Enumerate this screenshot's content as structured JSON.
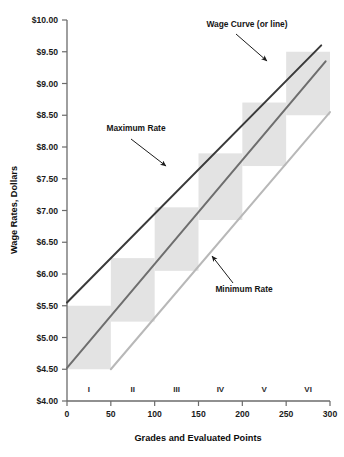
{
  "chart_data": {
    "type": "area",
    "title": "",
    "xlabel": "Grades and Evaluated Points",
    "ylabel": "Wage Rates, Dollars",
    "xlim": [
      0,
      300
    ],
    "ylim": [
      4.0,
      10.0
    ],
    "grid": false,
    "legend_position": "none",
    "x_ticks": [
      "0",
      "50",
      "100",
      "150",
      "200",
      "250",
      "300"
    ],
    "x_tick_values": [
      0,
      50,
      100,
      150,
      200,
      250,
      300
    ],
    "y_ticks": [
      "$4.00",
      "$4.50",
      "$5.00",
      "$5.50",
      "$6.00",
      "$6.50",
      "$7.00",
      "$7.50",
      "$8.00",
      "$8.50",
      "$9.00",
      "$9.50",
      "$10.00"
    ],
    "y_tick_values": [
      4.0,
      4.5,
      5.0,
      5.5,
      6.0,
      6.5,
      7.0,
      7.5,
      8.0,
      8.5,
      9.0,
      9.5,
      10.0
    ],
    "grade_labels": [
      "I",
      "II",
      "III",
      "IV",
      "V",
      "VI"
    ],
    "grade_boxes": [
      {
        "grade": "I",
        "x_start": 0,
        "x_end": 50,
        "y_min": 4.5,
        "y_max": 5.5
      },
      {
        "grade": "II",
        "x_start": 50,
        "x_end": 100,
        "y_min": 5.25,
        "y_max": 6.25
      },
      {
        "grade": "III",
        "x_start": 100,
        "x_end": 150,
        "y_min": 6.05,
        "y_max": 7.05
      },
      {
        "grade": "IV",
        "x_start": 150,
        "x_end": 200,
        "y_min": 6.85,
        "y_max": 7.9
      },
      {
        "grade": "V",
        "x_start": 200,
        "x_end": 250,
        "y_min": 7.7,
        "y_max": 8.7
      },
      {
        "grade": "VI",
        "x_start": 250,
        "x_end": 300,
        "y_min": 8.5,
        "y_max": 9.5
      }
    ],
    "series": [
      {
        "name": "Maximum Rate",
        "color": "#3a3a3a",
        "x": [
          0,
          290
        ],
        "values": [
          5.55,
          9.6
        ]
      },
      {
        "name": "Wage Curve (or line)",
        "color": "#6e6e6e",
        "x": [
          0,
          295
        ],
        "values": [
          4.52,
          9.35
        ]
      },
      {
        "name": "Minimum Rate",
        "color": "#b8b8b8",
        "x": [
          50,
          300
        ],
        "values": [
          4.5,
          8.55
        ]
      }
    ],
    "annotations": [
      {
        "text": "Wage Curve (or line)",
        "target_series": "Wage Curve (or line)"
      },
      {
        "text": "Maximum Rate",
        "target_series": "Maximum Rate"
      },
      {
        "text": "Minimum Rate",
        "target_series": "Minimum Rate"
      }
    ],
    "box_fill_color": "#e3e3e3",
    "axis_color": "#6b6b6b"
  }
}
